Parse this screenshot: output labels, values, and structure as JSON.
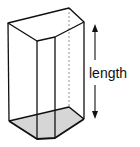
{
  "diagram": {
    "shape": "pentagonal-prism",
    "label": "length",
    "colors": {
      "stroke": "#111111",
      "base_fill": "#d6d6d6",
      "background": "#ffffff"
    },
    "top_face": [
      [
        8,
        23
      ],
      [
        69,
        8
      ],
      [
        84,
        22
      ],
      [
        55,
        37
      ],
      [
        37,
        41
      ]
    ],
    "bottom_face": [
      [
        9,
        121
      ],
      [
        69,
        107
      ],
      [
        84,
        119
      ],
      [
        55,
        138
      ],
      [
        37,
        139
      ]
    ],
    "hidden_edge": "dashed vertical edge at back-right",
    "arrow": {
      "x": 95,
      "y_top": 24,
      "y_bottom": 119,
      "direction": "double-headed vertical"
    }
  }
}
